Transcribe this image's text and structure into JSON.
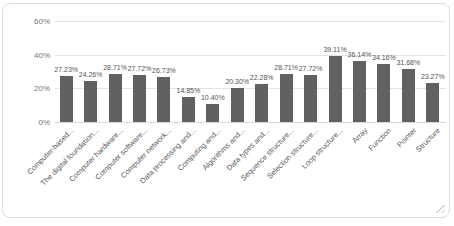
{
  "chart_data": {
    "type": "bar",
    "title": "",
    "categories": [
      "Computer-based...",
      "The digital foundation...",
      "Computer hardware...",
      "Computer software...",
      "Computer network...",
      "Data processing and...",
      "Computing and...",
      "Algorithms and...",
      "Data types and...",
      "Sequence structure...",
      "Selection structure...",
      "Loop structure...",
      "Array",
      "Function",
      "Pointer",
      "Structure"
    ],
    "values": [
      27.23,
      24.26,
      28.71,
      27.72,
      26.73,
      14.85,
      10.4,
      20.3,
      22.28,
      28.71,
      27.72,
      39.11,
      36.14,
      34.16,
      31.68,
      23.27
    ],
    "labels": [
      "27.23%",
      "24.26%",
      "28.71%",
      "27.72%",
      "26.73%",
      "14.85%",
      "10.40%",
      "20.30%",
      "22.28%",
      "28.71%",
      "27.72%",
      "39.11%",
      "36.14%",
      "34.16%",
      "31.68%",
      "23.27%"
    ],
    "y_ticks": [
      "60%",
      "40%",
      "20%",
      "0%"
    ],
    "ylim": [
      0,
      60
    ],
    "grid": true,
    "legend": "none",
    "bar_color": "#616161",
    "value_label_color": "#555555",
    "category_label_color": "#5a5a5a",
    "axis_tick_color": "#757575",
    "gridline_color": "#e4e4e4"
  }
}
